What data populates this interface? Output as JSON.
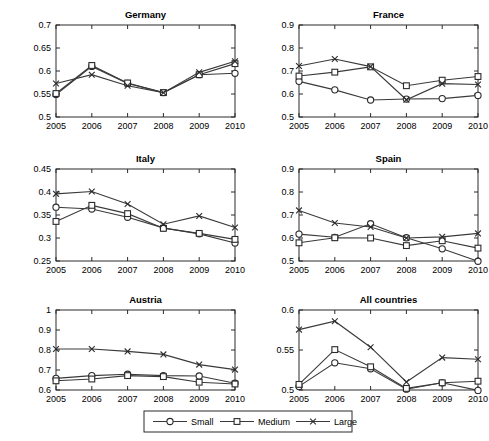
{
  "figure": {
    "width": 489,
    "height": 441,
    "background": "#ffffff",
    "line_color": "#3a3a3a",
    "axis_color": "#2b2b2b"
  },
  "legend": {
    "position": "bottom-center",
    "entries": [
      {
        "label": "Small",
        "marker": "circle-marker"
      },
      {
        "label": "Medium",
        "marker": "square-marker"
      },
      {
        "label": "Large",
        "marker": "x-marker"
      }
    ]
  },
  "chart_data": [
    {
      "type": "line",
      "title": "Germany",
      "xlabel": "",
      "ylabel": "",
      "x": [
        2005,
        2006,
        2007,
        2008,
        2009,
        2010
      ],
      "xticklabels": [
        "2005",
        "2006",
        "2007",
        "2008",
        "2009",
        "2010"
      ],
      "xlim": [
        2005,
        2010
      ],
      "ylim": [
        0.5,
        0.7
      ],
      "yticks": [
        0.5,
        0.55,
        0.6,
        0.65,
        0.7
      ],
      "yticklabels": [
        "0.5",
        "0.55",
        "0.6",
        "0.65",
        "0.7"
      ],
      "grid": false,
      "series": [
        {
          "name": "Small",
          "marker": "circle-marker",
          "values": [
            0.549,
            0.61,
            0.573,
            0.553,
            0.592,
            0.595
          ]
        },
        {
          "name": "Medium",
          "marker": "square-marker",
          "values": [
            0.551,
            0.612,
            0.574,
            0.553,
            0.592,
            0.616
          ]
        },
        {
          "name": "Large",
          "marker": "x-marker",
          "values": [
            0.573,
            0.592,
            0.568,
            0.553,
            0.597,
            0.621
          ]
        }
      ]
    },
    {
      "type": "line",
      "title": "France",
      "xlabel": "",
      "ylabel": "",
      "x": [
        2005,
        2006,
        2007,
        2008,
        2009,
        2010
      ],
      "xticklabels": [
        "2005",
        "2006",
        "2007",
        "2008",
        "2009",
        "2010"
      ],
      "xlim": [
        2005,
        2010
      ],
      "ylim": [
        0.5,
        0.9
      ],
      "yticks": [
        0.5,
        0.6,
        0.7,
        0.8,
        0.9
      ],
      "yticklabels": [
        "0.5",
        "0.6",
        "0.7",
        "0.8",
        "0.9"
      ],
      "grid": false,
      "series": [
        {
          "name": "Small",
          "marker": "circle-marker",
          "values": [
            0.655,
            0.618,
            0.574,
            0.578,
            0.58,
            0.594
          ]
        },
        {
          "name": "Medium",
          "marker": "square-marker",
          "values": [
            0.678,
            0.695,
            0.718,
            0.636,
            0.66,
            0.676
          ]
        },
        {
          "name": "Large",
          "marker": "x-marker",
          "values": [
            0.722,
            0.752,
            0.719,
            0.575,
            0.645,
            0.641
          ]
        }
      ]
    },
    {
      "type": "line",
      "title": "Italy",
      "xlabel": "",
      "ylabel": "",
      "x": [
        2005,
        2006,
        2007,
        2008,
        2009,
        2010
      ],
      "xticklabels": [
        "2005",
        "2006",
        "2007",
        "2008",
        "2009",
        "2010"
      ],
      "xlim": [
        2005,
        2010
      ],
      "ylim": [
        0.25,
        0.45
      ],
      "yticks": [
        0.25,
        0.3,
        0.35,
        0.4,
        0.45
      ],
      "yticklabels": [
        "0.25",
        "0.3",
        "0.35",
        "0.4",
        "0.45"
      ],
      "grid": false,
      "series": [
        {
          "name": "Small",
          "marker": "circle-marker",
          "values": [
            0.367,
            0.363,
            0.345,
            0.322,
            0.309,
            0.289
          ]
        },
        {
          "name": "Medium",
          "marker": "square-marker",
          "values": [
            0.336,
            0.371,
            0.353,
            0.321,
            0.31,
            0.297
          ]
        },
        {
          "name": "Large",
          "marker": "x-marker",
          "values": [
            0.396,
            0.401,
            0.374,
            0.33,
            0.348,
            0.323
          ]
        }
      ]
    },
    {
      "type": "line",
      "title": "Spain",
      "xlabel": "",
      "ylabel": "",
      "x": [
        2005,
        2006,
        2007,
        2008,
        2009,
        2010
      ],
      "xticklabels": [
        "2005",
        "2006",
        "2007",
        "2008",
        "2009",
        "2010"
      ],
      "xlim": [
        2005,
        2010
      ],
      "ylim": [
        0.5,
        0.9
      ],
      "yticks": [
        0.5,
        0.6,
        0.7,
        0.8,
        0.9
      ],
      "yticklabels": [
        "0.5",
        "0.6",
        "0.7",
        "0.8",
        "0.9"
      ],
      "grid": false,
      "series": [
        {
          "name": "Small",
          "marker": "circle-marker",
          "values": [
            0.617,
            0.603,
            0.662,
            0.601,
            0.553,
            0.499
          ]
        },
        {
          "name": "Medium",
          "marker": "square-marker",
          "values": [
            0.579,
            0.601,
            0.6,
            0.567,
            0.588,
            0.556
          ]
        },
        {
          "name": "Large",
          "marker": "x-marker",
          "values": [
            0.72,
            0.665,
            0.648,
            0.6,
            0.605,
            0.62
          ]
        }
      ]
    },
    {
      "type": "line",
      "title": "Austria",
      "xlabel": "",
      "ylabel": "",
      "x": [
        2005,
        2006,
        2007,
        2008,
        2009,
        2010
      ],
      "xticklabels": [
        "2005",
        "2006",
        "2007",
        "2008",
        "2009",
        "2010"
      ],
      "xlim": [
        2005,
        2010
      ],
      "ylim": [
        0.6,
        1.0
      ],
      "yticks": [
        0.6,
        0.7,
        0.8,
        0.9,
        1.0
      ],
      "yticklabels": [
        "0.6",
        "0.7",
        "0.8",
        "0.9",
        "1"
      ],
      "grid": false,
      "series": [
        {
          "name": "Small",
          "marker": "circle-marker",
          "values": [
            0.658,
            0.672,
            0.679,
            0.672,
            0.67,
            0.634
          ]
        },
        {
          "name": "Medium",
          "marker": "square-marker",
          "values": [
            0.646,
            0.655,
            0.672,
            0.667,
            0.639,
            0.63
          ]
        },
        {
          "name": "Large",
          "marker": "x-marker",
          "values": [
            0.805,
            0.805,
            0.793,
            0.778,
            0.727,
            0.702
          ]
        }
      ]
    },
    {
      "type": "line",
      "title": "All countries",
      "xlabel": "",
      "ylabel": "",
      "x": [
        2005,
        2006,
        2007,
        2008,
        2009,
        2010
      ],
      "xticklabels": [
        "2005",
        "2006",
        "2007",
        "2008",
        "2009",
        "2010"
      ],
      "xlim": [
        2005,
        2010
      ],
      "ylim": [
        0.5,
        0.6
      ],
      "yticks": [
        0.5,
        0.55,
        0.6
      ],
      "yticklabels": [
        "0.5",
        "0.55",
        "0.6"
      ],
      "grid": false,
      "series": [
        {
          "name": "Small",
          "marker": "circle-marker",
          "values": [
            0.5045,
            0.534,
            0.5265,
            0.501,
            0.509,
            0.4995
          ]
        },
        {
          "name": "Medium",
          "marker": "square-marker",
          "values": [
            0.507,
            0.5505,
            0.529,
            0.502,
            0.509,
            0.511
          ]
        },
        {
          "name": "Large",
          "marker": "x-marker",
          "values": [
            0.5755,
            0.586,
            0.5535,
            0.51,
            0.5405,
            0.5385
          ]
        }
      ]
    }
  ]
}
